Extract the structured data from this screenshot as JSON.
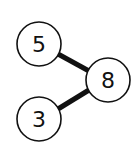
{
  "diagram": {
    "type": "number-bond",
    "nodes": [
      {
        "id": "part-top",
        "label": "5",
        "cx": 39,
        "cy": 44,
        "r": 22
      },
      {
        "id": "whole",
        "label": "8",
        "cx": 108,
        "cy": 80,
        "r": 22
      },
      {
        "id": "part-bottom",
        "label": "3",
        "cx": 39,
        "cy": 119,
        "r": 22
      }
    ],
    "edges": [
      {
        "from": "part-top",
        "to": "whole"
      },
      {
        "from": "part-bottom",
        "to": "whole"
      }
    ],
    "colors": {
      "stroke": "#111111",
      "fill": "#ffffff",
      "background": "#ffffff"
    }
  }
}
